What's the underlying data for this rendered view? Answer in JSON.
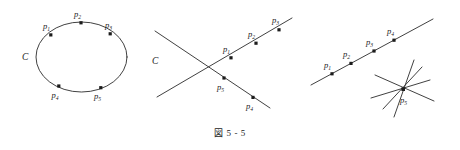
{
  "caption": {
    "text": "図 5 - 5"
  },
  "figures": [
    {
      "id": "conic-ellipse",
      "name": "ellipse-with-five-points",
      "curve_label": "C",
      "points": [
        {
          "label": "p",
          "sub": "1"
        },
        {
          "label": "p",
          "sub": "2"
        },
        {
          "label": "p",
          "sub": "3"
        },
        {
          "label": "p",
          "sub": "4"
        },
        {
          "label": "p",
          "sub": "5"
        }
      ]
    },
    {
      "id": "conic-crossing-lines",
      "name": "two-crossing-lines-with-five-points",
      "curve_label": "C",
      "points": [
        {
          "label": "p",
          "sub": "1"
        },
        {
          "label": "p",
          "sub": "2"
        },
        {
          "label": "p",
          "sub": "3"
        },
        {
          "label": "p",
          "sub": "4"
        },
        {
          "label": "p",
          "sub": "5"
        }
      ]
    },
    {
      "id": "line-and-pencil",
      "name": "line-with-four-points-and-pencil",
      "curve_label": "",
      "points": [
        {
          "label": "p",
          "sub": "1"
        },
        {
          "label": "p",
          "sub": "2"
        },
        {
          "label": "p",
          "sub": "3"
        },
        {
          "label": "p",
          "sub": "4"
        },
        {
          "label": "p",
          "sub": "5"
        }
      ]
    }
  ]
}
